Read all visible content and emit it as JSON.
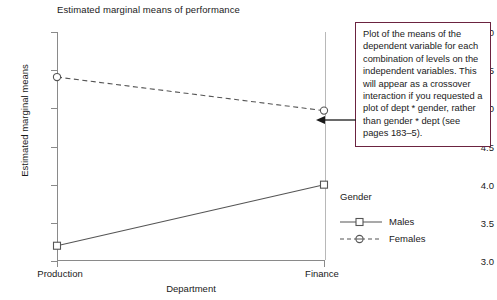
{
  "chart_data": {
    "type": "line",
    "title": "Estimated marginal means of performance",
    "xlabel": "Department",
    "ylabel": "Estimated marginal means",
    "categories": [
      "Production",
      "Finance"
    ],
    "xticklabels": [
      "Production",
      "Finance"
    ],
    "yticklabels": [
      "3.0",
      "3.5",
      "4.0",
      "4.5",
      "5.0",
      "5.5",
      "6.0"
    ],
    "yticks": [
      3.0,
      3.5,
      4.0,
      4.5,
      5.0,
      5.5,
      6.0
    ],
    "ylim": [
      3.0,
      6.0
    ],
    "grid": false,
    "legend_position": "right",
    "legend_title": "Gender",
    "series": [
      {
        "name": "Males",
        "values": [
          3.2,
          4.0
        ],
        "linestyle": "solid",
        "marker": "square",
        "color": "#555555"
      },
      {
        "name": "Females",
        "values": [
          5.41,
          4.97
        ],
        "linestyle": "dashed",
        "marker": "circle",
        "color": "#555555"
      }
    ]
  },
  "callout": {
    "text": "Plot of the means of the dependent variable for each combination of levels on the independent variables. This will appear as a crossover interaction if you requested a plot of dept * gender, rather than gender * dept (see pages 183–5).",
    "border_color": "#6b2340"
  }
}
